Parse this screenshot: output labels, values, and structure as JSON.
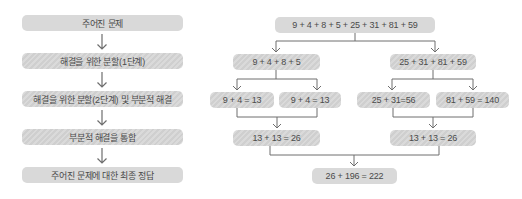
{
  "left_flow": {
    "steps": [
      {
        "label": "주어진 문제",
        "style": "solid"
      },
      {
        "label": "해결을 위한 분할(1단계)",
        "style": "hatch"
      },
      {
        "label": "해결을 위한 분할(2단계) 및 부분적 해결",
        "style": "hatch"
      },
      {
        "label": "부분적 해결을 통합",
        "style": "hatch"
      },
      {
        "label": "주어진 문제에 대한 최종 정답",
        "style": "solid"
      }
    ]
  },
  "tree": {
    "root": "9 + 4 + 8 + 5 + 25 + 31 + 81 + 59",
    "level1": [
      "9 + 4 + 8 + 5",
      "25 + 31 + 81 + 59"
    ],
    "level2": [
      "9 + 4 = 13",
      "9 + 4 = 13",
      "25 + 31=56",
      "81 + 59 = 140"
    ],
    "level3": [
      "13 + 13 = 26",
      "13 + 13 = 26"
    ],
    "final": "26 + 196 = 222"
  },
  "colors": {
    "box_fill": "#d9d9d9",
    "line": "#6e6e6e",
    "text": "#4a4a4a"
  }
}
